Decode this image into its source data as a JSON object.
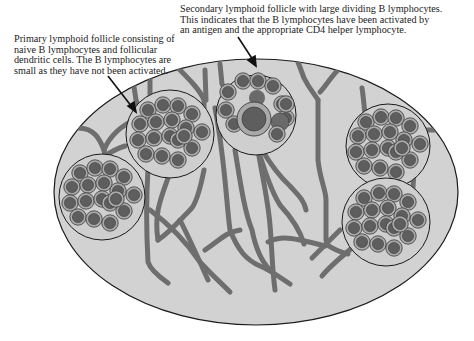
{
  "diagram": {
    "colors": {
      "node_fill": "#cfcfcf",
      "vessel": "#6e6e6e",
      "cell_ring": "#a9a9a9",
      "cell_nucleus": "#5e5e5e",
      "outline": "#1a1a1a"
    },
    "captions": {
      "primary": {
        "lines": [
          "Primary lymphoid follicle consisting of",
          "naive B lymphocytes and follicular",
          "dendritic cells. The B lymphocytes are",
          "small as they have not been activated."
        ]
      },
      "secondary": {
        "lines": [
          "Secondary lymphoid follicle with large dividing B lymphocytes.",
          "This indicates that the B lymphocytes have been activated by",
          "an antigen and the appropriate CD4 helper lymphocyte."
        ]
      }
    },
    "follicles": [
      {
        "type": "primary",
        "label": "primary-follicle-top-left"
      },
      {
        "type": "secondary",
        "label": "secondary-follicle-top-center"
      },
      {
        "type": "primary",
        "label": "primary-follicle-right"
      },
      {
        "type": "primary",
        "label": "primary-follicle-left"
      },
      {
        "type": "primary",
        "label": "primary-follicle-bottom-right"
      }
    ]
  }
}
